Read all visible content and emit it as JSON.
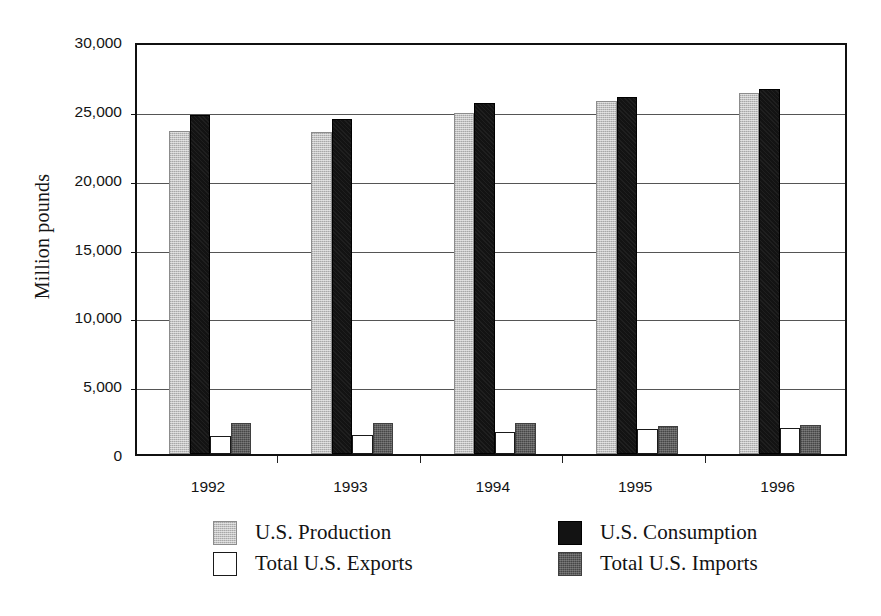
{
  "chart_data": {
    "type": "bar",
    "title": "",
    "subtitle": "",
    "xlabel": "",
    "ylabel": "Million pounds",
    "categories": [
      "1992",
      "1993",
      "1994",
      "1995",
      "1996"
    ],
    "ylim": [
      0,
      30000
    ],
    "yticks": [
      0,
      5000,
      10000,
      15000,
      20000,
      25000,
      30000
    ],
    "ytick_labels": [
      "0",
      "5,000",
      "10,000",
      "15,000",
      "20,000",
      "25,000",
      "30,000"
    ],
    "grid": true,
    "grid_axis": "y",
    "legend_position": "bottom",
    "legend_columns": 2,
    "series": [
      {
        "name": "U.S. Production",
        "color": "#c2c2c2",
        "border_color": "#8c8c8c",
        "values": [
          23450,
          23400,
          24750,
          25650,
          26250
        ]
      },
      {
        "name": "U.S. Consumption",
        "color": "#131313",
        "border_color": "#000000",
        "values": [
          24600,
          24350,
          25500,
          25950,
          26500
        ]
      },
      {
        "name": "Total U.S. Exports",
        "color": "#ffffff",
        "border_color": "#1a1a1a",
        "values": [
          1300,
          1350,
          1600,
          1850,
          1900
        ]
      },
      {
        "name": "Total U.S. Imports",
        "color": "#5e5e5e",
        "border_color": "#3f3f3f",
        "values": [
          2250,
          2250,
          2250,
          2050,
          2100
        ]
      }
    ]
  },
  "axes": {
    "y_title": "Million pounds",
    "frame_color": "#101010",
    "gridline_color": "#555555"
  },
  "legend": {
    "entries": [
      {
        "label": "U.S. Production",
        "swatch": "production"
      },
      {
        "label": "U.S. Consumption",
        "swatch": "consumption"
      },
      {
        "label": "Total U.S. Exports",
        "swatch": "exports"
      },
      {
        "label": "Total U.S. Imports",
        "swatch": "imports"
      }
    ]
  }
}
